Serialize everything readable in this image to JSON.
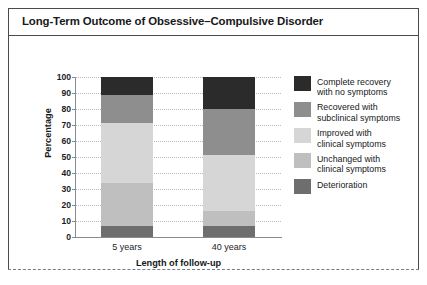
{
  "chart": {
    "title": "Long-Term Outcome of Obsessive–Compulsive Disorder"
  },
  "chart_data": {
    "type": "bar",
    "subtype": "stacked-bar-100",
    "title": "Long-Term Outcome of Obsessive–Compulsive Disorder",
    "xlabel": "Length of follow-up",
    "ylabel": "Percentage",
    "categories": [
      "5 years",
      "40 years"
    ],
    "ylim": [
      0,
      100
    ],
    "yticks": [
      0,
      10,
      20,
      30,
      40,
      50,
      60,
      70,
      80,
      90,
      100
    ],
    "grid": true,
    "legend_position": "right",
    "series": [
      {
        "name": "Complete recovery with no symptoms",
        "name_line1": "Complete recovery",
        "name_line2": "with no symptoms",
        "color": "#2b2b2b",
        "values": [
          11,
          20
        ]
      },
      {
        "name": "Recovered with subclinical symptoms",
        "name_line1": "Recovered with",
        "name_line2": "subclinical symptoms",
        "color": "#8e8e8e",
        "values": [
          18,
          29
        ]
      },
      {
        "name": "Improved with clinical symptoms",
        "name_line1": "Improved with",
        "name_line2": "clinical symptoms",
        "color": "#d6d6d6",
        "values": [
          37,
          35
        ]
      },
      {
        "name": "Unchanged with clinical symptoms",
        "name_line1": "Unchanged with",
        "name_line2": "clinical symptoms",
        "color": "#bfbfbf",
        "values": [
          27,
          9
        ]
      },
      {
        "name": "Deterioration",
        "name_line1": "Deterioration",
        "name_line2": "",
        "color": "#6e6e6e",
        "values": [
          7,
          7
        ]
      }
    ]
  }
}
